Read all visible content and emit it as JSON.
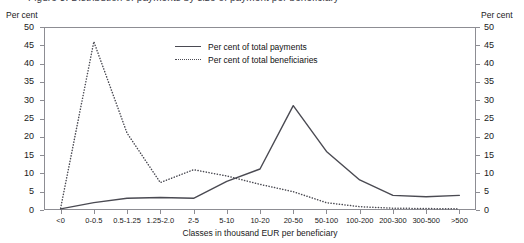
{
  "title_partial": "Figure 3. Distribution of payments by size of payment per beneficiary",
  "axis_unit_left": "Per cent",
  "axis_unit_right": "Per cent",
  "legend": {
    "items": [
      {
        "label": "Per cent of total payments",
        "style": "solid"
      },
      {
        "label": "Per cent of total beneficiaries",
        "style": "dotted"
      }
    ]
  },
  "chart_data": {
    "type": "line",
    "title": "Figure 3. Distribution of payments by size of payment per beneficiary",
    "xlabel": "Classes in thousand EUR per beneficiary",
    "ylabel": "Per cent",
    "ylim": [
      0,
      50
    ],
    "yticks": [
      0,
      5,
      10,
      15,
      20,
      25,
      30,
      35,
      40,
      45,
      50
    ],
    "grid": false,
    "legend_position": "inside-top-center",
    "categories": [
      "<0",
      "0-0.5",
      "0.5-1.25",
      "1.25-2.0",
      "2-5",
      "5-10",
      "10-20",
      "20-50",
      "50-100",
      "100-200",
      "200-300",
      "300-500",
      ">500"
    ],
    "series": [
      {
        "name": "Per cent of total payments",
        "style": "solid",
        "color": "#4a4a52",
        "values": [
          0.3,
          2.0,
          3.2,
          3.4,
          3.2,
          7.8,
          11.2,
          28.5,
          16.0,
          8.2,
          4.0,
          3.6,
          4.0
        ]
      },
      {
        "name": "Per cent of total beneficiaries",
        "style": "dotted",
        "color": "#4a4a52",
        "values": [
          0.5,
          46.0,
          21.0,
          7.5,
          11.0,
          9.3,
          7.0,
          5.0,
          2.0,
          0.9,
          0.5,
          0.4,
          0.3
        ]
      }
    ]
  }
}
